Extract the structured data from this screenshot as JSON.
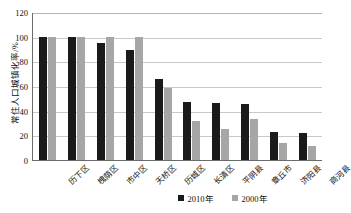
{
  "chart_data": {
    "type": "bar",
    "title": "",
    "xlabel": "",
    "ylabel": "常住人口城镇化率/%",
    "ylim": [
      0,
      120
    ],
    "yticks": [
      0,
      20,
      40,
      60,
      80,
      100,
      120
    ],
    "grid": true,
    "legend_position": "bottom",
    "categories": [
      "历下区",
      "槐荫区",
      "市中区",
      "天桥区",
      "历城区",
      "长清区",
      "平阴县",
      "章丘市",
      "济阳县",
      "商河县"
    ],
    "series": [
      {
        "name": "2010年",
        "color": "#1a1a1a",
        "values": [
          100,
          100,
          95,
          89,
          66,
          47,
          46,
          45.5,
          22.5,
          22
        ]
      },
      {
        "name": "2000年",
        "color": "#a6a6a6",
        "values": [
          100,
          100,
          100,
          100,
          58.5,
          32,
          25,
          33.5,
          14,
          11
        ]
      }
    ]
  },
  "axis": {
    "y_title": "常住人口城镇化率/%"
  },
  "legend": {
    "items": [
      {
        "label": "2010年",
        "color": "#1a1a1a"
      },
      {
        "label": "2000年",
        "color": "#a6a6a6"
      }
    ]
  }
}
